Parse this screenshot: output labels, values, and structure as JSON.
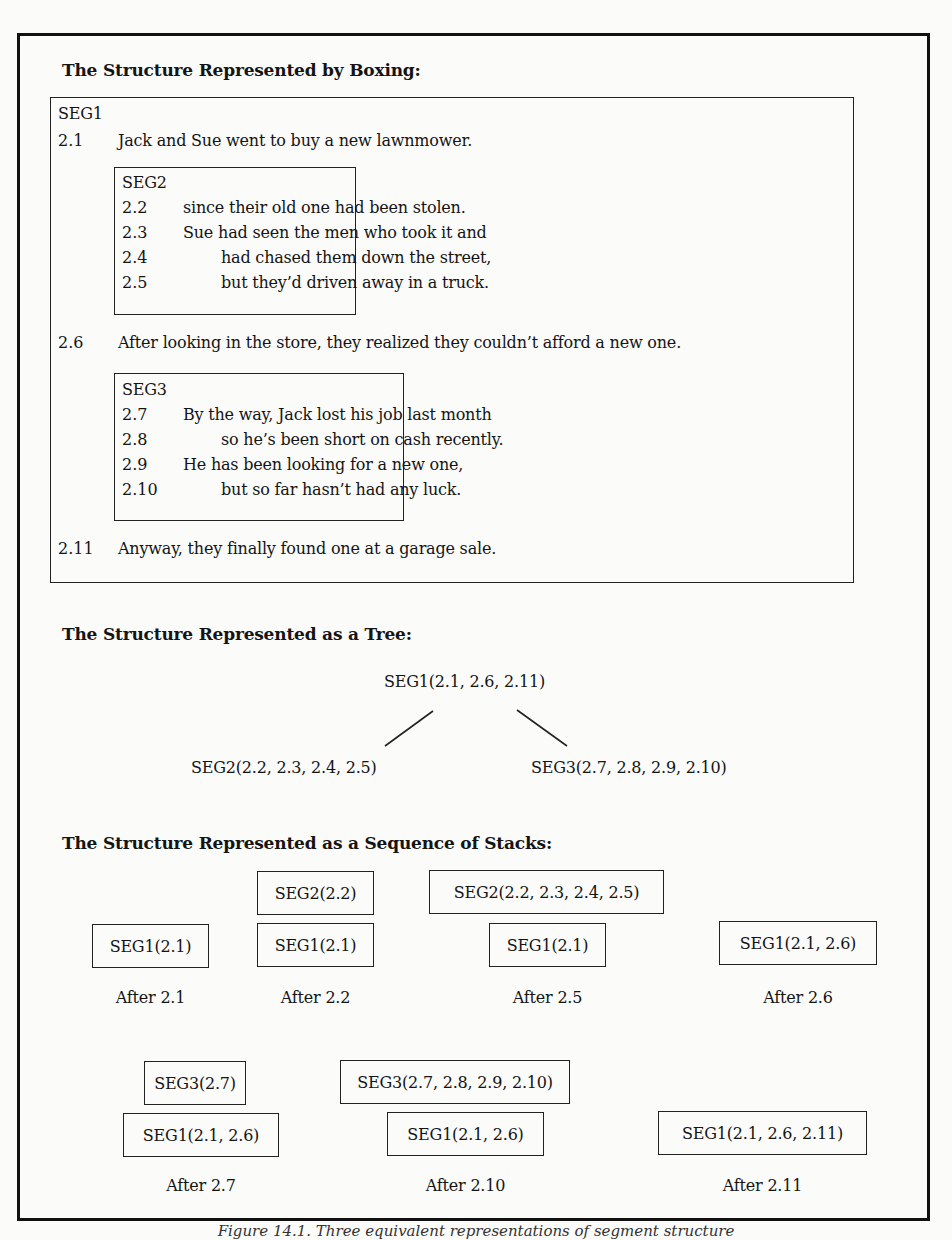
{
  "sections": {
    "boxing": {
      "heading": "The Structure Represented by Boxing:",
      "seg1": {
        "label": "SEG1",
        "lines": [
          {
            "num": "2.1",
            "text": "Jack and Sue went to buy a new lawnmower."
          },
          {
            "num": "2.6",
            "text": "After looking in the store, they realized they couldn’t afford a new one."
          },
          {
            "num": "2.11",
            "text": "Anyway, they finally found one at a garage sale."
          }
        ]
      },
      "seg2": {
        "label": "SEG2",
        "lines": [
          {
            "num": "2.2",
            "text": "since their old one had been stolen."
          },
          {
            "num": "2.3",
            "text": "Sue had seen the men who took it and"
          },
          {
            "num": "2.4",
            "text": "had chased them down the street,"
          },
          {
            "num": "2.5",
            "text": "but they’d driven away in a truck."
          }
        ]
      },
      "seg3": {
        "label": "SEG3",
        "lines": [
          {
            "num": "2.7",
            "text": "By the way, Jack lost his job last month"
          },
          {
            "num": "2.8",
            "text": "so he’s been short on cash recently."
          },
          {
            "num": "2.9",
            "text": "He has been looking for a new one,"
          },
          {
            "num": "2.10",
            "text": "but so far hasn’t had any luck."
          }
        ]
      }
    },
    "tree": {
      "heading": "The Structure Represented as a Tree:",
      "root": "SEG1(2.1, 2.6, 2.11)",
      "left_child": "SEG2(2.2, 2.3, 2.4, 2.5)",
      "right_child": "SEG3(2.7, 2.8, 2.9, 2.10)"
    },
    "stacks": {
      "heading": "The Structure Represented as a Sequence of Stacks:",
      "row1": [
        {
          "label": "After 2.1",
          "stack": [
            "SEG1(2.1)"
          ]
        },
        {
          "label": "After 2.2",
          "stack": [
            "SEG2(2.2)",
            "SEG1(2.1)"
          ]
        },
        {
          "label": "After 2.5",
          "stack": [
            "SEG2(2.2, 2.3, 2.4, 2.5)",
            "SEG1(2.1)"
          ]
        },
        {
          "label": "After 2.6",
          "stack": [
            "SEG1(2.1, 2.6)"
          ]
        }
      ],
      "row2": [
        {
          "label": "After 2.7",
          "stack": [
            "SEG3(2.7)",
            "SEG1(2.1, 2.6)"
          ]
        },
        {
          "label": "After 2.10",
          "stack": [
            "SEG3(2.7, 2.8, 2.9, 2.10)",
            "SEG1(2.1, 2.6)"
          ]
        },
        {
          "label": "After 2.11",
          "stack": [
            "SEG1(2.1, 2.6, 2.11)"
          ]
        }
      ]
    }
  },
  "caption": "Figure 14.1. Three equivalent representations of segment structure"
}
